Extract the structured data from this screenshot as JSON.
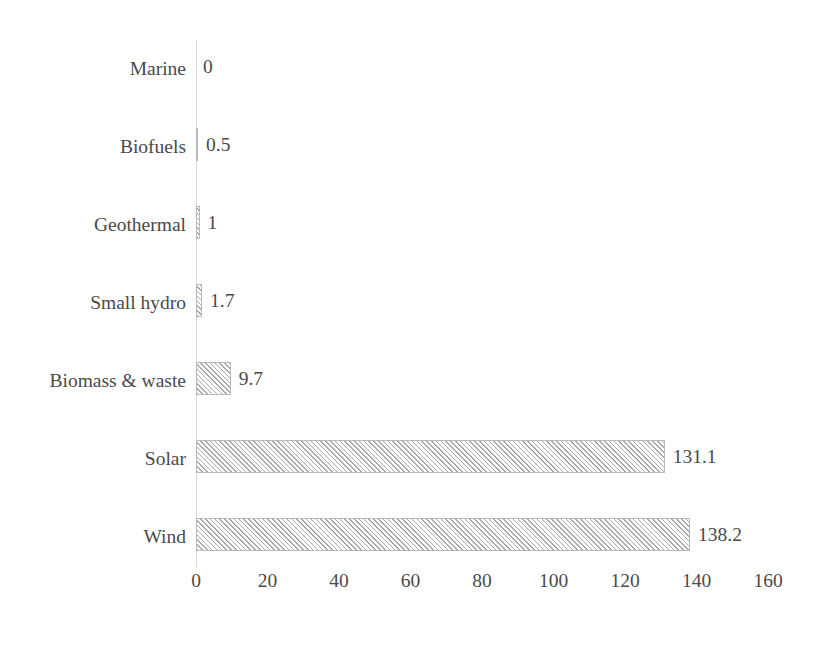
{
  "chart_data": {
    "type": "bar",
    "orientation": "horizontal",
    "title": "",
    "xlabel": "",
    "ylabel": "",
    "grid": false,
    "legend": false,
    "xlim": [
      0,
      160
    ],
    "xticks": [
      "0",
      "20",
      "40",
      "60",
      "80",
      "100",
      "120",
      "140",
      "160"
    ],
    "xtick_values": [
      0,
      20,
      40,
      60,
      80,
      100,
      120,
      140,
      160
    ],
    "categories": [
      "Marine",
      "Biofuels",
      "Geothermal",
      "Small hydro",
      "Biomass & waste",
      "Solar",
      "Wind"
    ],
    "values": [
      0,
      0.5,
      1,
      1.7,
      9.7,
      131.1,
      138.2
    ],
    "data_labels": [
      "0",
      "0.5",
      "1",
      "1.7",
      "9.7",
      "131.1",
      "138.2"
    ],
    "bars": [
      {
        "category": "Marine",
        "value": 0,
        "label": "0"
      },
      {
        "category": "Biofuels",
        "value": 0.5,
        "label": "0.5"
      },
      {
        "category": "Geothermal",
        "value": 1,
        "label": "1"
      },
      {
        "category": "Small hydro",
        "value": 1.7,
        "label": "1.7"
      },
      {
        "category": "Biomass & waste",
        "value": 9.7,
        "label": "9.7"
      },
      {
        "category": "Solar",
        "value": 131.1,
        "label": "131.1"
      },
      {
        "category": "Wind",
        "value": 138.2,
        "label": "138.2"
      }
    ],
    "style": {
      "bar_fill": "#ffffff",
      "bar_hatch": "diagonal",
      "bar_hatch_color": "#a9a9a9",
      "bar_border": "#b9b9b9",
      "text_color": "#4a4a4a",
      "axis_color": "#d8d8d8",
      "background": "#ffffff"
    }
  }
}
